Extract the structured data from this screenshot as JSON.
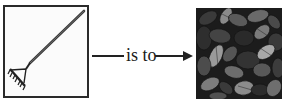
{
  "analogy": {
    "left_item": {
      "label": "rake",
      "icon": "rake-icon"
    },
    "relation_text": "is to",
    "right_item": {
      "label": "leaves",
      "icon": "leaves-image"
    }
  },
  "colors": {
    "ink": "#222222",
    "frame": "#2a2a2a",
    "leaf_dark": "#1c1c1c",
    "leaf_mid": "#4a4a4a",
    "leaf_light": "#9a9a9a"
  }
}
